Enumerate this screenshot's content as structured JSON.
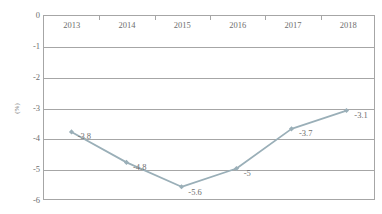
{
  "chart_data": {
    "type": "line",
    "title": "",
    "xlabel": "",
    "ylabel": "(%)",
    "categories": [
      "2013",
      "2014",
      "2015",
      "2016",
      "2017",
      "2018"
    ],
    "values": [
      -3.8,
      -4.8,
      -5.6,
      -5,
      -3.7,
      -3.1
    ],
    "point_labels": [
      "-3.8",
      "-4.8",
      "-5.6",
      "-5",
      "-3.7",
      "-3.1"
    ],
    "ylim": [
      -6,
      0
    ],
    "y_ticks": [
      "0",
      "-1",
      "-2",
      "-3",
      "-4",
      "-5",
      "-6"
    ],
    "y_tick_values": [
      0,
      -1,
      -2,
      -3,
      -4,
      -5,
      -6
    ],
    "grid": true,
    "legend": "none",
    "series": [
      {
        "name": "",
        "values": [
          -3.8,
          -4.8,
          -5.6,
          -5,
          -3.7,
          -3.1
        ]
      }
    ],
    "colors": {
      "line": "#9aafb8",
      "marker": "#9aafb8",
      "grid": "#a6a6a6",
      "axis": "#a6a6a6",
      "text": "#6e6e6e",
      "background": "#ffffff"
    }
  }
}
